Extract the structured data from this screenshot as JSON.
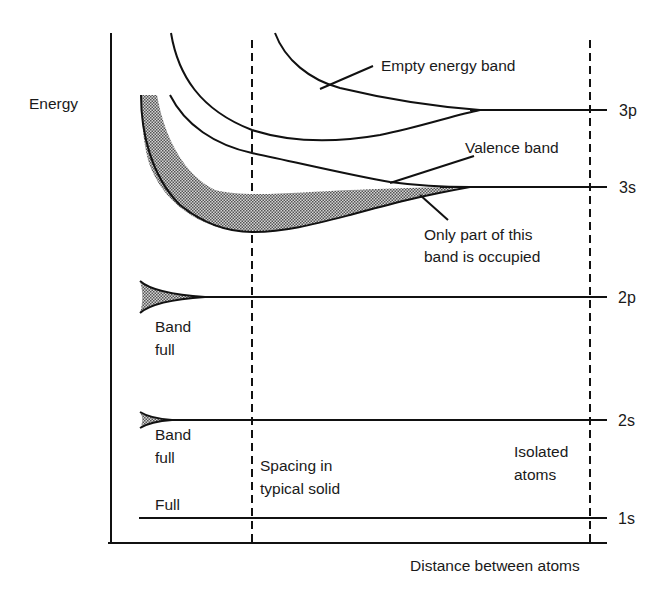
{
  "diagram": {
    "axes": {
      "y_label": "Energy",
      "x_label": "Distance between atoms"
    },
    "levels": [
      {
        "name": "3p",
        "label": "3p"
      },
      {
        "name": "3s",
        "label": "3s"
      },
      {
        "name": "2p",
        "label": "2p"
      },
      {
        "name": "2s",
        "label": "2s"
      },
      {
        "name": "1s",
        "label": "1s"
      }
    ],
    "markers": {
      "spacing_line1": "Spacing in",
      "spacing_line2": "typical solid",
      "isolated_line1": "Isolated",
      "isolated_line2": "atoms"
    },
    "annotations": {
      "empty_band": "Empty energy band",
      "valence_band": "Valence band",
      "partial_line1": "Only part of this",
      "partial_line2": "band is occupied",
      "band_full_2p_line1": "Band",
      "band_full_2p_line2": "full",
      "band_full_2s_line1": "Band",
      "band_full_2s_line2": "full",
      "full_1s": "Full"
    },
    "colors": {
      "line": "#111111",
      "shade": "#8a8a8a",
      "background": "#ffffff"
    }
  }
}
